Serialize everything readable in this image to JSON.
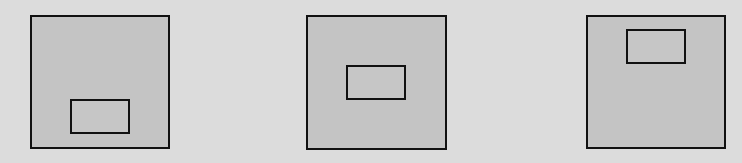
{
  "figure": {
    "background_color": "#dcdcdc",
    "panel_fill_color": "#c4c4c4",
    "border_color": "#111111",
    "panels": [
      {
        "id": "panel-1",
        "position": "left",
        "box": {
          "x": 30,
          "y": 15,
          "width": 140,
          "height": 134
        },
        "inner_rect": {
          "placement": "bottom-center",
          "x": 70,
          "y": 99,
          "width": 60,
          "height": 35
        }
      },
      {
        "id": "panel-2",
        "position": "middle",
        "box": {
          "x": 306,
          "y": 15,
          "width": 141,
          "height": 135
        },
        "inner_rect": {
          "placement": "center",
          "x": 346,
          "y": 65,
          "width": 60,
          "height": 35
        }
      },
      {
        "id": "panel-3",
        "position": "right",
        "box": {
          "x": 586,
          "y": 15,
          "width": 140,
          "height": 134
        },
        "inner_rect": {
          "placement": "top-center",
          "x": 626,
          "y": 29,
          "width": 60,
          "height": 35
        }
      }
    ]
  }
}
